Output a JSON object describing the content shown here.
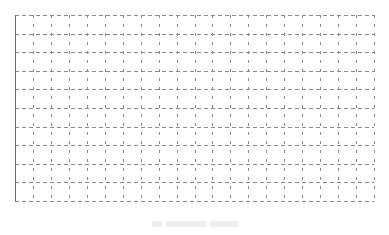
{
  "chart_data": {
    "type": "line",
    "title": "",
    "xlabel": "",
    "ylabel": "",
    "series": [],
    "grid": {
      "on": true,
      "style": "dashed",
      "major_rows": 10,
      "major_cols": 20,
      "minor_ticks_between": true
    },
    "plot_area": {
      "left": 15,
      "top": 15,
      "right": 374,
      "bottom": 201
    },
    "colors": {
      "grid": "#8a8a8a",
      "axis": "#6a6a6a",
      "background": "#ffffff"
    },
    "caption": {
      "visible": true,
      "legible": false
    }
  }
}
